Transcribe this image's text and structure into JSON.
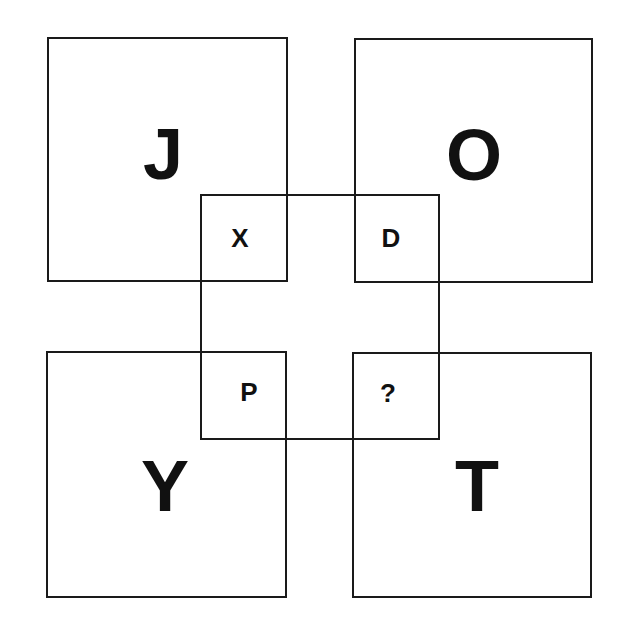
{
  "puzzle": {
    "outer_squares": {
      "top_left": "J",
      "top_right": "O",
      "bottom_left": "Y",
      "bottom_right": "T"
    },
    "overlap_cells": {
      "top_left": "X",
      "top_right": "D",
      "bottom_left": "P",
      "bottom_right": "?"
    }
  },
  "colors": {
    "line": "#1a1a1a",
    "text": "#111111",
    "background": "#ffffff"
  }
}
